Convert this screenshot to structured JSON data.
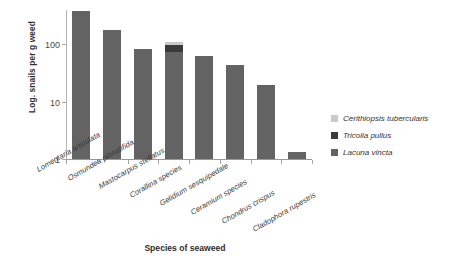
{
  "chart_data": {
    "type": "bar",
    "subtype": "stacked-bar-log-scale",
    "title": "",
    "xlabel": "Species of seaweed",
    "ylabel": "Log. snails per g weed",
    "yscale": "log",
    "ylim": [
      1,
      400
    ],
    "yticks": [
      1,
      10,
      100
    ],
    "ytick_labels": [
      "1",
      "10",
      "100"
    ],
    "grid": false,
    "legend_position": "right",
    "categories": [
      "Lomentaria articulata",
      "Osmundea pinnatifida",
      "Mastocarpus stellatus",
      "Corallina species",
      "Gelidium sesquipedale",
      "Ceramium species",
      "Chondrus crispus",
      "Cladophora rupestris"
    ],
    "series": [
      {
        "name": "Lacuna vincta",
        "color": "#636363",
        "values": [
          385,
          177,
          82,
          75,
          62,
          44,
          20,
          1.3
        ]
      },
      {
        "name": "Tricolia pullus",
        "color": "#3a3a3a",
        "values": [
          0,
          0,
          0,
          22,
          0,
          0,
          0,
          0
        ]
      },
      {
        "name": "Cerithiopsis tubercularis",
        "color": "#c9c9c9",
        "values": [
          0,
          0,
          0,
          12,
          0,
          0,
          0,
          0
        ]
      }
    ],
    "totals": [
      385,
      177,
      82,
      109,
      62,
      44,
      20,
      1.3
    ]
  },
  "axes": {
    "y_title": "Log. snails per g weed",
    "x_title": "Species of seaweed",
    "y_tick_labels": [
      "100",
      "10",
      "1"
    ]
  },
  "legend": {
    "items": [
      {
        "label": "Cerithiopsis tubercularis",
        "color": "#c9c9c9"
      },
      {
        "label": "Tricolia pullus",
        "color": "#3a3a3a"
      },
      {
        "label": "Lacuna vincta",
        "color": "#636363"
      }
    ]
  },
  "colors": {
    "axis": "#a8a8a8",
    "bar_default": "#636363",
    "background": "#ffffff"
  }
}
